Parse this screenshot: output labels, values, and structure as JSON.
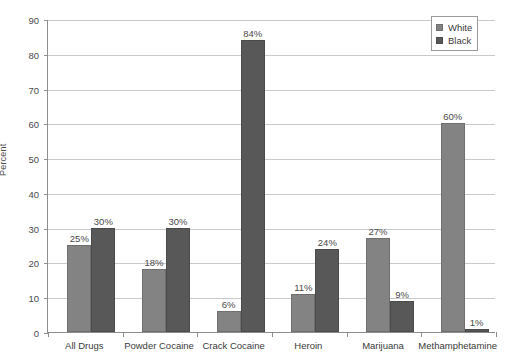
{
  "chart_data": {
    "type": "bar",
    "title": "",
    "xlabel": "",
    "ylabel": "Percent",
    "ylim": [
      0,
      90
    ],
    "ytick_step": 10,
    "yticks": [
      0,
      10,
      20,
      30,
      40,
      50,
      60,
      70,
      80,
      90
    ],
    "grid": true,
    "legend_position": "top-right",
    "value_suffix": "%",
    "categories": [
      "All Drugs",
      "Powder Cocaine",
      "Crack Cocaine",
      "Heroin",
      "Marijuana",
      "Methamphetamine"
    ],
    "series": [
      {
        "name": "White",
        "color": "#838383",
        "values": [
          25,
          18,
          6,
          11,
          27,
          60
        ],
        "labels": [
          "25%",
          "18%",
          "6%",
          "11%",
          "27%",
          "60%"
        ]
      },
      {
        "name": "Black",
        "color": "#585858",
        "values": [
          30,
          30,
          84,
          24,
          9,
          1
        ],
        "labels": [
          "30%",
          "30%",
          "84%",
          "24%",
          "9%",
          "1%"
        ]
      }
    ]
  },
  "legend": {
    "items": [
      {
        "label": "White"
      },
      {
        "label": "Black"
      }
    ]
  },
  "axis": {
    "y_title": "Percent",
    "y_tick_labels": [
      "0",
      "10",
      "20",
      "30",
      "40",
      "50",
      "60",
      "70",
      "80",
      "90"
    ]
  }
}
